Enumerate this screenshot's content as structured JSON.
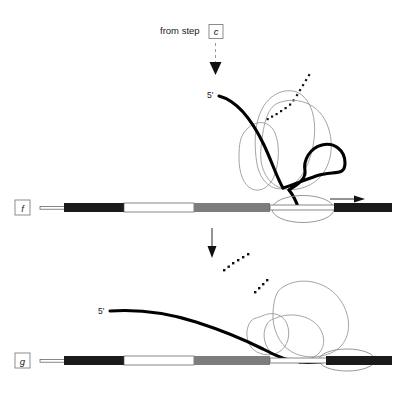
{
  "figure": {
    "background": "#ffffff",
    "width": 404,
    "height": 398
  },
  "entry": {
    "text": "from step",
    "step_ref": "c",
    "arrow": "down-dashed-arrow"
  },
  "panels": [
    {
      "id": "panel-f",
      "label": "f",
      "prime_label": "5'",
      "transition_arrow": "down-solid-arrow",
      "direction_arrow": "right-arrow",
      "features": [
        "polymerase-blob",
        "helicase-blob",
        "dna-loop-circle",
        "replication-bubble",
        "dotted-strand"
      ]
    },
    {
      "id": "panel-g",
      "label": "g",
      "prime_label": "5'",
      "features": [
        "polymerase-blob",
        "helicase-blob",
        "replication-bubble",
        "dotted-strand",
        "released-strand"
      ]
    }
  ],
  "dna_bar": {
    "segments": [
      {
        "name": "leading-thin-left",
        "color": "#ffffff",
        "x": 40,
        "width": 24,
        "height": 3
      },
      {
        "name": "black-segment",
        "color": "#1a1a1a",
        "x": 64,
        "width": 60,
        "height": 8
      },
      {
        "name": "white-segment",
        "color": "#ffffff",
        "x": 124,
        "width": 70,
        "height": 8
      },
      {
        "name": "gray-segment",
        "color": "#7d7d7d",
        "x": 194,
        "width": 76,
        "height": 8
      },
      {
        "name": "light-segment",
        "color": "#f2f2f2",
        "x": 270,
        "width": 72,
        "height": 8
      },
      {
        "name": "black-right",
        "color": "#1a1a1a",
        "x": 342,
        "width": 50,
        "height": 8
      }
    ],
    "outline_color": "#555555"
  },
  "colors": {
    "strand_dark": "#000000",
    "blob_outline": "#9a9a9a",
    "bar_black": "#1a1a1a",
    "bar_gray": "#7d7d7d",
    "bar_white": "#ffffff",
    "text": "#1a1a1a",
    "arrow": "#111111"
  }
}
